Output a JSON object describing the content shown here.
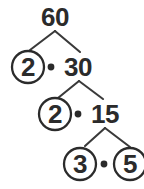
{
  "figure": {
    "name": "factor-tree",
    "root_value": "60",
    "ink_color": "#2b2b2b",
    "line_color": "#3a3a3a",
    "background_color": "#ffffff"
  },
  "nodes": {
    "root": {
      "label": "60",
      "circled": false
    },
    "level1": {
      "left": {
        "label": "2",
        "circled": true
      },
      "operator": "•",
      "right": {
        "label": "30",
        "circled": false
      }
    },
    "level2": {
      "left": {
        "label": "2",
        "circled": true
      },
      "operator": "•",
      "right": {
        "label": "15",
        "circled": false
      }
    },
    "level3": {
      "left": {
        "label": "3",
        "circled": true
      },
      "operator": "•",
      "right": {
        "label": "5",
        "circled": true
      }
    }
  }
}
